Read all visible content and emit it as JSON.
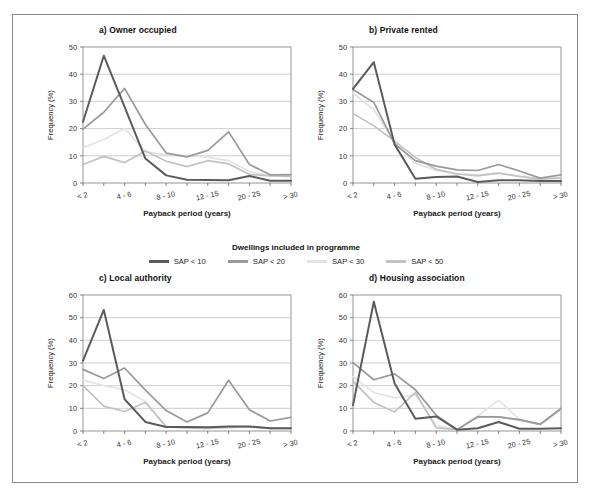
{
  "figure": {
    "legend_title": "Dwellings included in programme"
  },
  "series_meta": [
    {
      "name": "SAP < 10",
      "color": "#5b5b5b"
    },
    {
      "name": "SAP < 20",
      "color": "#9a9a9a"
    },
    {
      "name": "SAP < 30",
      "color": "#e3e3e3"
    },
    {
      "name": "SAP < 50",
      "color": "#c2c2c2"
    }
  ],
  "axes": {
    "xlabel": "Payback period (years)",
    "ylabel": "Frequency (%)",
    "categories": [
      "< 2",
      "2 - 4",
      "4 - 6",
      "6 - 8",
      "8 - 10",
      "10 - 12",
      "12 - 15",
      "15 - 20",
      "20 - 25",
      "25 - 30",
      "> 30"
    ],
    "tick_labels": [
      "< 2",
      "",
      "4 - 6",
      "",
      "8 - 10",
      "",
      "12 - 15",
      "",
      "20 - 25",
      "",
      "> 30"
    ]
  },
  "chart_data": [
    {
      "type": "line",
      "title": "a) Owner occupied",
      "xlabel": "Payback period (years)",
      "ylabel": "Frequency (%)",
      "categories": [
        "< 2",
        "2 - 4",
        "4 - 6",
        "6 - 8",
        "8 - 10",
        "10 - 12",
        "12 - 15",
        "15 - 20",
        "20 - 25",
        "25 - 30",
        "> 30"
      ],
      "ylim": [
        0,
        50
      ],
      "yticks": [
        0,
        10,
        20,
        30,
        40,
        50
      ],
      "grid": true,
      "legend_position": "below-figure",
      "series": [
        {
          "name": "SAP < 10",
          "color": "#5b5b5b",
          "values": [
            22.5,
            46.8,
            28.0,
            9.0,
            2.8,
            1.2,
            1.1,
            1.0,
            2.6,
            0.8,
            0.8
          ]
        },
        {
          "name": "SAP < 20",
          "color": "#9a9a9a",
          "values": [
            19.8,
            26.0,
            34.8,
            21.5,
            11.0,
            9.6,
            12.0,
            18.8,
            6.8,
            3.0,
            3.1
          ]
        },
        {
          "name": "SAP < 30",
          "color": "#e3e3e3",
          "values": [
            13.0,
            16.0,
            20.0,
            11.5,
            10.4,
            10.2,
            9.4,
            8.2,
            4.2,
            2.8,
            2.6
          ]
        },
        {
          "name": "SAP < 50",
          "color": "#c2c2c2",
          "values": [
            6.8,
            9.8,
            7.5,
            11.8,
            8.0,
            6.0,
            8.2,
            7.0,
            3.2,
            2.6,
            2.4
          ]
        }
      ]
    },
    {
      "type": "line",
      "title": "b) Private rented",
      "xlabel": "Payback period (years)",
      "ylabel": "Frequency (%)",
      "categories": [
        "< 2",
        "2 - 4",
        "4 - 6",
        "6 - 8",
        "8 - 10",
        "10 - 12",
        "12 - 15",
        "15 - 20",
        "20 - 25",
        "25 - 30",
        "> 30"
      ],
      "ylim": [
        0,
        50
      ],
      "yticks": [
        0,
        10,
        20,
        30,
        40,
        50
      ],
      "grid": true,
      "legend_position": "below-figure",
      "series": [
        {
          "name": "SAP < 10",
          "color": "#5b5b5b",
          "values": [
            34.6,
            44.4,
            14.2,
            1.6,
            2.2,
            2.4,
            0.4,
            1.0,
            1.0,
            0.7,
            0.7
          ]
        },
        {
          "name": "SAP < 20",
          "color": "#9a9a9a",
          "values": [
            34.4,
            29.6,
            14.4,
            8.2,
            6.2,
            4.8,
            4.6,
            6.8,
            4.4,
            1.8,
            3.0
          ]
        },
        {
          "name": "SAP < 30",
          "color": "#e3e3e3",
          "values": [
            33.0,
            27.0,
            14.8,
            7.2,
            4.6,
            3.2,
            3.0,
            3.6,
            2.6,
            1.6,
            2.0
          ]
        },
        {
          "name": "SAP < 50",
          "color": "#c2c2c2",
          "values": [
            25.6,
            21.0,
            15.4,
            9.4,
            5.0,
            3.4,
            2.6,
            3.6,
            2.4,
            1.4,
            1.8
          ]
        }
      ]
    },
    {
      "type": "line",
      "title": "c) Local authority",
      "xlabel": "Payback period (years)",
      "ylabel": "Frequency (%)",
      "categories": [
        "< 2",
        "2 - 4",
        "4 - 6",
        "6 - 8",
        "8 - 10",
        "10 - 12",
        "12 - 15",
        "15 - 20",
        "20 - 25",
        "25 - 30",
        "> 30"
      ],
      "ylim": [
        0,
        60
      ],
      "yticks": [
        0,
        10,
        20,
        30,
        40,
        50,
        60
      ],
      "grid": true,
      "legend_position": "below-figure",
      "series": [
        {
          "name": "SAP < 10",
          "color": "#5b5b5b",
          "values": [
            31.0,
            53.4,
            14.0,
            4.0,
            1.8,
            1.8,
            1.6,
            2.0,
            2.0,
            1.2,
            1.2
          ]
        },
        {
          "name": "SAP < 20",
          "color": "#9a9a9a",
          "values": [
            27.2,
            23.2,
            27.8,
            18.0,
            9.0,
            4.0,
            8.0,
            22.4,
            9.4,
            4.4,
            6.0
          ]
        },
        {
          "name": "SAP < 30",
          "color": "#e3e3e3",
          "values": [
            22.4,
            20.0,
            18.2,
            13.0,
            2.0,
            1.4,
            1.2,
            1.6,
            1.6,
            1.2,
            1.2
          ]
        },
        {
          "name": "SAP < 50",
          "color": "#c2c2c2",
          "values": [
            20.0,
            11.0,
            8.6,
            12.6,
            1.8,
            1.4,
            1.2,
            1.6,
            1.8,
            1.2,
            1.2
          ]
        }
      ]
    },
    {
      "type": "line",
      "title": "d) Housing association",
      "xlabel": "Payback period (years)",
      "ylabel": "Frequency (%)",
      "categories": [
        "< 2",
        "2 - 4",
        "4 - 6",
        "6 - 8",
        "8 - 10",
        "10 - 12",
        "12 - 15",
        "15 - 20",
        "20 - 25",
        "25 - 30",
        "> 30"
      ],
      "ylim": [
        0,
        60
      ],
      "yticks": [
        0,
        10,
        20,
        30,
        40,
        50,
        60
      ],
      "grid": true,
      "legend_position": "below-figure",
      "series": [
        {
          "name": "SAP < 10",
          "color": "#5b5b5b",
          "values": [
            11.4,
            57.0,
            21.0,
            5.4,
            6.4,
            0.6,
            1.2,
            4.0,
            1.0,
            1.0,
            1.2
          ]
        },
        {
          "name": "SAP < 20",
          "color": "#9a9a9a",
          "values": [
            30.2,
            22.6,
            25.2,
            18.2,
            7.0,
            0.6,
            6.2,
            6.2,
            5.0,
            3.0,
            10.0
          ]
        },
        {
          "name": "SAP < 30",
          "color": "#e3e3e3",
          "values": [
            24.0,
            17.0,
            14.6,
            16.0,
            2.4,
            0.6,
            6.6,
            13.6,
            5.0,
            3.0,
            9.8
          ]
        },
        {
          "name": "SAP < 50",
          "color": "#c2c2c2",
          "values": [
            22.0,
            12.6,
            8.4,
            17.0,
            1.4,
            0.6,
            6.4,
            6.2,
            4.8,
            2.8,
            9.6
          ]
        }
      ]
    }
  ]
}
